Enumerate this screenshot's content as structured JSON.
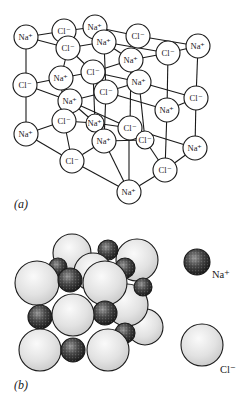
{
  "panel_a": {
    "label": "(a)",
    "label_pos": [
      14,
      208
    ],
    "radius": 12,
    "edges": [
      [
        [
          26,
          37
        ],
        [
          26,
          85
        ]
      ],
      [
        [
          26,
          85
        ],
        [
          26,
          134
        ]
      ],
      [
        [
          198,
          46
        ],
        [
          196,
          98
        ]
      ],
      [
        [
          196,
          98
        ],
        [
          195,
          148
        ]
      ],
      [
        [
          129,
          192
        ],
        [
          129,
          128
        ]
      ],
      [
        [
          26,
          37
        ],
        [
          64,
          31
        ]
      ],
      [
        [
          64,
          31
        ],
        [
          95,
          27
        ]
      ],
      [
        [
          95,
          27
        ],
        [
          138,
          36
        ]
      ],
      [
        [
          138,
          36
        ],
        [
          198,
          46
        ]
      ],
      [
        [
          26,
          37
        ],
        [
          68,
          48
        ]
      ],
      [
        [
          68,
          48
        ],
        [
          104,
          42
        ]
      ],
      [
        [
          104,
          42
        ],
        [
          168,
          53
        ]
      ],
      [
        [
          168,
          53
        ],
        [
          198,
          46
        ]
      ],
      [
        [
          64,
          31
        ],
        [
          68,
          48
        ]
      ],
      [
        [
          95,
          27
        ],
        [
          104,
          42
        ]
      ],
      [
        [
          138,
          36
        ],
        [
          131,
          60
        ]
      ],
      [
        [
          104,
          42
        ],
        [
          131,
          60
        ]
      ],
      [
        [
          68,
          48
        ],
        [
          93,
          72
        ]
      ],
      [
        [
          93,
          72
        ],
        [
          131,
          60
        ]
      ],
      [
        [
          131,
          60
        ],
        [
          168,
          53
        ]
      ],
      [
        [
          26,
          85
        ],
        [
          61,
          78
        ]
      ],
      [
        [
          61,
          78
        ],
        [
          93,
          72
        ]
      ],
      [
        [
          93,
          72
        ],
        [
          139,
          82
        ]
      ],
      [
        [
          139,
          82
        ],
        [
          196,
          98
        ]
      ],
      [
        [
          26,
          85
        ],
        [
          70,
          101
        ]
      ],
      [
        [
          70,
          101
        ],
        [
          106,
          92
        ]
      ],
      [
        [
          106,
          92
        ],
        [
          139,
          82
        ]
      ],
      [
        [
          61,
          78
        ],
        [
          70,
          101
        ]
      ],
      [
        [
          68,
          48
        ],
        [
          61,
          78
        ]
      ],
      [
        [
          106,
          92
        ],
        [
          167,
          110
        ]
      ],
      [
        [
          167,
          110
        ],
        [
          196,
          98
        ]
      ],
      [
        [
          26,
          134
        ],
        [
          64,
          121
        ]
      ],
      [
        [
          64,
          121
        ],
        [
          95,
          123
        ]
      ],
      [
        [
          95,
          123
        ],
        [
          130,
          128
        ]
      ],
      [
        [
          130,
          128
        ],
        [
          195,
          148
        ]
      ],
      [
        [
          26,
          134
        ],
        [
          72,
          161
        ]
      ],
      [
        [
          72,
          161
        ],
        [
          104,
          141
        ]
      ],
      [
        [
          104,
          141
        ],
        [
          145,
          140
        ]
      ],
      [
        [
          145,
          140
        ],
        [
          165,
          170
        ]
      ],
      [
        [
          72,
          161
        ],
        [
          129,
          192
        ]
      ],
      [
        [
          129,
          192
        ],
        [
          165,
          170
        ]
      ],
      [
        [
          165,
          170
        ],
        [
          195,
          148
        ]
      ],
      [
        [
          70,
          101
        ],
        [
          64,
          121
        ]
      ],
      [
        [
          70,
          101
        ],
        [
          95,
          123
        ]
      ],
      [
        [
          64,
          121
        ],
        [
          72,
          161
        ]
      ],
      [
        [
          106,
          92
        ],
        [
          104,
          141
        ]
      ],
      [
        [
          93,
          72
        ],
        [
          95,
          123
        ]
      ],
      [
        [
          131,
          60
        ],
        [
          130,
          128
        ]
      ],
      [
        [
          139,
          82
        ],
        [
          145,
          140
        ]
      ],
      [
        [
          168,
          53
        ],
        [
          167,
          110
        ]
      ],
      [
        [
          167,
          110
        ],
        [
          165,
          170
        ]
      ],
      [
        [
          104,
          42
        ],
        [
          106,
          92
        ]
      ],
      [
        [
          61,
          78
        ],
        [
          64,
          121
        ]
      ],
      [
        [
          104,
          141
        ],
        [
          129,
          192
        ]
      ],
      [
        [
          70,
          101
        ],
        [
          130,
          128
        ]
      ]
    ],
    "ions": [
      {
        "label": "Cl⁻",
        "pos": [
          64,
          31
        ]
      },
      {
        "label": "Na⁺",
        "pos": [
          95,
          27
        ]
      },
      {
        "label": "Cl⁻",
        "pos": [
          138,
          36
        ]
      },
      {
        "label": "Na⁺",
        "pos": [
          198,
          46
        ]
      },
      {
        "label": "Na⁺",
        "pos": [
          26,
          37
        ]
      },
      {
        "label": "Cl⁻",
        "pos": [
          68,
          48
        ]
      },
      {
        "label": "Na⁺",
        "pos": [
          104,
          42
        ]
      },
      {
        "label": "Cl⁻",
        "pos": [
          168,
          53
        ]
      },
      {
        "label": "Na⁺",
        "pos": [
          131,
          60
        ]
      },
      {
        "label": "Cl⁻",
        "pos": [
          93,
          72
        ]
      },
      {
        "label": "Na⁺",
        "pos": [
          61,
          78
        ]
      },
      {
        "label": "Cl⁻",
        "pos": [
          25,
          85
        ]
      },
      {
        "label": "Na⁺",
        "pos": [
          139,
          82
        ]
      },
      {
        "label": "Cl⁻",
        "pos": [
          106,
          92
        ]
      },
      {
        "label": "Cl⁻",
        "pos": [
          196,
          98
        ]
      },
      {
        "label": "Na⁺",
        "pos": [
          70,
          101
        ]
      },
      {
        "label": "Na⁺",
        "pos": [
          167,
          110
        ]
      },
      {
        "label": "Cl⁻",
        "pos": [
          64,
          121
        ]
      },
      {
        "label": "Na⁺",
        "pos": [
          95,
          123
        ],
        "hidden_circle": true
      },
      {
        "label": "Cl⁻",
        "pos": [
          130,
          128
        ]
      },
      {
        "label": "Cl⁻",
        "pos": [
          145,
          140
        ],
        "hidden_circle": true
      },
      {
        "label": "Na⁺",
        "pos": [
          104,
          141
        ]
      },
      {
        "label": "Na⁺",
        "pos": [
          26,
          134
        ]
      },
      {
        "label": "Na⁺",
        "pos": [
          195,
          148
        ]
      },
      {
        "label": "Cl⁻",
        "pos": [
          72,
          161
        ]
      },
      {
        "label": "Cl⁻",
        "pos": [
          165,
          170
        ]
      },
      {
        "label": "Na⁺",
        "pos": [
          129,
          192
        ]
      }
    ]
  },
  "panel_b": {
    "label": "(b)",
    "label_pos": [
      14,
      389
    ],
    "colors": {
      "cl_fill": "#e4e4e4",
      "cl_highlight": "#f8f8f8",
      "na_fill": "#2a2a2a",
      "na_speckle": "#8a8a8a"
    },
    "spheres": [
      {
        "ion": "Cl",
        "pos": [
          72,
          253
        ],
        "r": 19
      },
      {
        "ion": "Cl",
        "pos": [
          137,
          260
        ],
        "r": 21
      },
      {
        "ion": "Na",
        "pos": [
          108,
          250
        ],
        "r": 10
      },
      {
        "ion": "Cl",
        "pos": [
          145,
          327
        ],
        "r": 18
      },
      {
        "ion": "Cl",
        "pos": [
          127,
          305
        ],
        "r": 21
      },
      {
        "ion": "Na",
        "pos": [
          143,
          287
        ],
        "r": 9
      },
      {
        "ion": "Na",
        "pos": [
          125,
          268
        ],
        "r": 10
      },
      {
        "ion": "Cl",
        "pos": [
          93,
          272
        ],
        "r": 19
      },
      {
        "ion": "Na",
        "pos": [
          58,
          267
        ],
        "r": 9
      },
      {
        "ion": "Na",
        "pos": [
          125,
          333
        ],
        "r": 10
      },
      {
        "ion": "Cl",
        "pos": [
          37,
          283
        ],
        "r": 22
      },
      {
        "ion": "Na",
        "pos": [
          70,
          280
        ],
        "r": 12
      },
      {
        "ion": "Cl",
        "pos": [
          105,
          283
        ],
        "r": 22
      },
      {
        "ion": "Na",
        "pos": [
          40,
          317
        ],
        "r": 12
      },
      {
        "ion": "Na",
        "pos": [
          105,
          313
        ],
        "r": 12
      },
      {
        "ion": "Cl",
        "pos": [
          73,
          315
        ],
        "r": 21
      },
      {
        "ion": "Cl",
        "pos": [
          40,
          350
        ],
        "r": 21
      },
      {
        "ion": "Na",
        "pos": [
          73,
          350
        ],
        "r": 12
      },
      {
        "ion": "Cl",
        "pos": [
          108,
          350
        ],
        "r": 21
      }
    ],
    "legend": [
      {
        "ion": "Na",
        "label": "Na⁺",
        "sphere_pos": [
          197,
          262
        ],
        "r": 13,
        "label_pos": [
          212,
          278
        ]
      },
      {
        "ion": "Cl",
        "label": "Cl⁻",
        "sphere_pos": [
          202,
          345
        ],
        "r": 21,
        "label_pos": [
          220,
          373
        ]
      }
    ]
  }
}
